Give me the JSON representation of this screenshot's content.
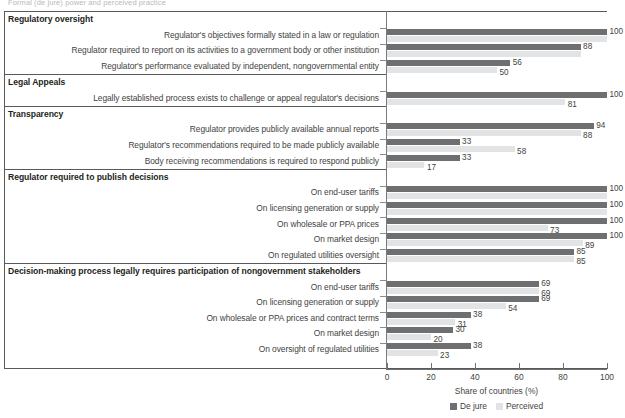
{
  "clipped_header_text": "Formal (de jure) power and perceived practice",
  "axis": {
    "x_title": "Share of countries (%)",
    "x_ticks": [
      0,
      20,
      40,
      60,
      80,
      100
    ],
    "x_min": 0,
    "x_max": 100
  },
  "legend": {
    "position": "bottom-center",
    "entries": [
      {
        "label": "De jure",
        "color": "#6e6f71"
      },
      {
        "label": "Perceived",
        "color": "#e2e3e4"
      }
    ]
  },
  "chart_data": {
    "type": "bar",
    "orientation": "horizontal",
    "title": "",
    "xlabel": "Share of countries (%)",
    "ylabel": "",
    "xlim": [
      0,
      100
    ],
    "grid": false,
    "legend_position": "bottom-center",
    "series": [
      {
        "name": "De jure",
        "color": "#6e6f71"
      },
      {
        "name": "Perceived",
        "color": "#e2e3e4"
      }
    ],
    "sections": [
      {
        "heading": "Regulatory oversight",
        "rows": [
          {
            "category": "Regulator's objectives formally stated in a law or regulation",
            "de_jure": 100,
            "perceived": 100,
            "de_jure_label": "100",
            "perceived_label": ""
          },
          {
            "category": "Regulator required to report on its activities to a government body or other institution",
            "de_jure": 88,
            "perceived": 88,
            "de_jure_label": "88",
            "perceived_label": ""
          },
          {
            "category": "Regulator's performance evaluated by independent, nongovernmental entity",
            "de_jure": 56,
            "perceived": 50,
            "de_jure_label": "56",
            "perceived_label": "50"
          }
        ]
      },
      {
        "heading": "Legal Appeals",
        "rows": [
          {
            "category": "Legally established process exists to challenge or appeal regulator's decisions",
            "de_jure": 100,
            "perceived": 81,
            "de_jure_label": "100",
            "perceived_label": "81"
          }
        ]
      },
      {
        "heading": "Transparency",
        "rows": [
          {
            "category": "Regulator provides publicly available annual reports",
            "de_jure": 94,
            "perceived": 88,
            "de_jure_label": "94",
            "perceived_label": "88"
          },
          {
            "category": "Regulator's recommendations required to be made publicly available",
            "de_jure": 33,
            "perceived": 58,
            "de_jure_label": "33",
            "perceived_label": "58"
          },
          {
            "category": "Body receiving recommendations is required to respond publicly",
            "de_jure": 33,
            "perceived": 17,
            "de_jure_label": "33",
            "perceived_label": "17"
          }
        ]
      },
      {
        "heading": "Regulator required to publish decisions",
        "rows": [
          {
            "category": "On end-user tariffs",
            "de_jure": 100,
            "perceived": 100,
            "de_jure_label": "100",
            "perceived_label": ""
          },
          {
            "category": "On licensing generation or supply",
            "de_jure": 100,
            "perceived": 100,
            "de_jure_label": "100",
            "perceived_label": ""
          },
          {
            "category": "On wholesale or PPA prices",
            "de_jure": 100,
            "perceived": 73,
            "de_jure_label": "100",
            "perceived_label": "73"
          },
          {
            "category": "On market design",
            "de_jure": 100,
            "perceived": 89,
            "de_jure_label": "100",
            "perceived_label": "89"
          },
          {
            "category": "On regulated utilities oversight",
            "de_jure": 85,
            "perceived": 85,
            "de_jure_label": "85",
            "perceived_label": "85"
          }
        ]
      },
      {
        "heading": "Decision-making process legally requires participation of nongovernment stakeholders",
        "rows": [
          {
            "category": "On end-user tariffs",
            "de_jure": 69,
            "perceived": 69,
            "de_jure_label": "69",
            "perceived_label": "69"
          },
          {
            "category": "On licensing generation or supply",
            "de_jure": 69,
            "perceived": 54,
            "de_jure_label": "69",
            "perceived_label": "54"
          },
          {
            "category": "On wholesale or PPA prices and contract terms",
            "de_jure": 38,
            "perceived": 31,
            "de_jure_label": "38",
            "perceived_label": "31"
          },
          {
            "category": "On market design",
            "de_jure": 30,
            "perceived": 20,
            "de_jure_label": "30",
            "perceived_label": "20"
          },
          {
            "category": "On oversight of regulated utilities",
            "de_jure": 38,
            "perceived": 23,
            "de_jure_label": "38",
            "perceived_label": "23"
          }
        ]
      }
    ]
  }
}
